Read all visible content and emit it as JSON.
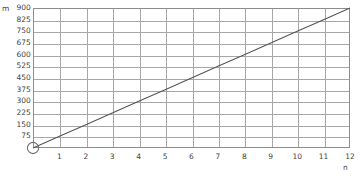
{
  "chart_data": {
    "type": "line",
    "title": "",
    "subtitle": "",
    "xlabel": "n",
    "ylabel": "m",
    "grid": true,
    "legend": null,
    "xlim": [
      0,
      12
    ],
    "ylim": [
      0,
      900
    ],
    "x_ticks": [
      1,
      2,
      3,
      4,
      5,
      6,
      7,
      8,
      9,
      10,
      11,
      12
    ],
    "x_tick_labels": [
      "1",
      "2",
      "3",
      "4",
      "5",
      "6",
      "7",
      "8",
      "9",
      "10",
      "11",
      "12"
    ],
    "y_ticks": [
      75,
      150,
      225,
      300,
      375,
      450,
      525,
      600,
      675,
      750,
      825,
      900
    ],
    "y_tick_labels": [
      "75",
      "150",
      "225",
      "300",
      "375",
      "450",
      "525",
      "600",
      "675",
      "750",
      "825",
      "900"
    ],
    "series": [
      {
        "name": "m = 75n",
        "color": "#555555",
        "x": [
          0,
          1,
          2,
          3,
          4,
          5,
          6,
          7,
          8,
          9,
          10,
          11,
          12
        ],
        "values": [
          0,
          75,
          150,
          225,
          300,
          375,
          450,
          525,
          600,
          675,
          750,
          825,
          900
        ]
      }
    ],
    "markers": [
      {
        "name": "origin-open-circle",
        "x": 0,
        "y": 0,
        "shape": "open-circle",
        "color": "#6d6d6d"
      }
    ],
    "colors": {
      "line": "#555555",
      "grid": "#a7a7a7",
      "frame": "#8d8d8d",
      "text": "#3f3f3f",
      "background": "#ffffff"
    }
  }
}
